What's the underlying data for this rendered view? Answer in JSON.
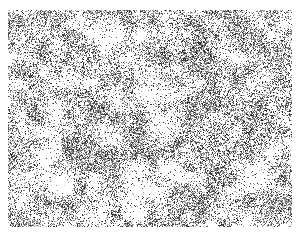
{
  "image": {
    "description": "Grayscale microscopy-style texture with dense dark reticular clusters on a white background",
    "width": 284,
    "height": 217,
    "offset_x": 8,
    "offset_y": 10,
    "colors": {
      "background": "#ffffff",
      "ink": "#1a1a1a"
    },
    "clearings": [
      {
        "x": 130,
        "y": 180,
        "r": 22
      },
      {
        "x": 105,
        "y": 25,
        "r": 14
      },
      {
        "x": 50,
        "y": 170,
        "r": 16
      },
      {
        "x": 160,
        "y": 85,
        "r": 12
      },
      {
        "x": 250,
        "y": 170,
        "r": 12
      }
    ]
  }
}
